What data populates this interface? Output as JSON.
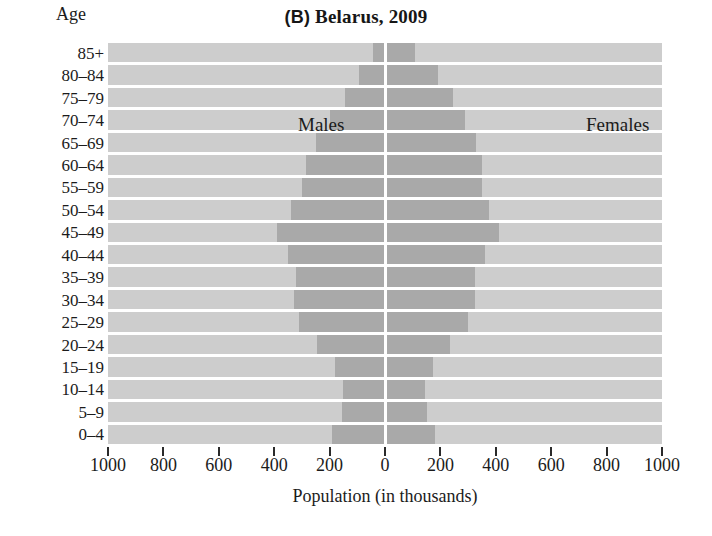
{
  "chart_data": {
    "type": "bar",
    "subtype": "population-pyramid",
    "title": "(B) Belarus, 2009",
    "panel_letter": "(B)",
    "title_rest": " Belarus, 2009",
    "xlabel": "Population (in thousands)",
    "ylabel": "Age",
    "xlim": [
      -1000,
      1000
    ],
    "xticks": [
      -1000,
      -800,
      -600,
      -400,
      -200,
      0,
      200,
      400,
      600,
      800,
      1000
    ],
    "xtick_labels": [
      "1000",
      "800",
      "600",
      "400",
      "200",
      "0",
      "200",
      "400",
      "600",
      "800",
      "1000"
    ],
    "grid": false,
    "legend_position": "in-plot",
    "series": [
      {
        "name": "Males",
        "side": "left",
        "values": [
          190,
          155,
          150,
          180,
          245,
          310,
          330,
          320,
          350,
          390,
          340,
          300,
          285,
          250,
          200,
          145,
          95,
          45
        ]
      },
      {
        "name": "Females",
        "side": "right",
        "values": [
          180,
          150,
          145,
          172,
          235,
          300,
          325,
          325,
          360,
          410,
          375,
          350,
          350,
          330,
          290,
          245,
          190,
          110
        ]
      }
    ],
    "categories": [
      "0–4",
      "5–9",
      "10–14",
      "15–19",
      "20–24",
      "25–29",
      "30–34",
      "35–39",
      "40–44",
      "45–49",
      "50–54",
      "55–59",
      "60–64",
      "65–69",
      "70–74",
      "75–79",
      "80–84",
      "85+"
    ],
    "categories_top_down": [
      "85+",
      "80–84",
      "75–79",
      "70–74",
      "65–69",
      "60–64",
      "55–59",
      "50–54",
      "45–49",
      "40–44",
      "35–39",
      "30–34",
      "25–29",
      "20–24",
      "15–19",
      "10–14",
      "5–9",
      "0–4"
    ],
    "colors": {
      "plot_background": "#cdcdcd",
      "bar": "#a9a9a9",
      "separator": "#ffffff",
      "axis_text": "#1b1b1b"
    }
  },
  "labels": {
    "males": "Males",
    "females": "Females",
    "age_axis": "Age"
  }
}
